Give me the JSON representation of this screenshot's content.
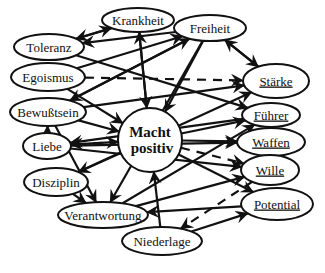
{
  "diagram": {
    "center": {
      "id": "macht",
      "line1": "Macht",
      "line2": "positiv",
      "x": 150,
      "y": 140,
      "r": 32
    },
    "nodes": [
      {
        "id": "krankheit",
        "label": "Krankheit",
        "x": 138,
        "y": 20,
        "rx": 36,
        "ry": 12,
        "underlined": false
      },
      {
        "id": "freiheit",
        "label": "Freiheit",
        "x": 210,
        "y": 28,
        "rx": 36,
        "ry": 13,
        "underlined": false
      },
      {
        "id": "toleranz",
        "label": "Toleranz",
        "x": 49,
        "y": 47,
        "rx": 35,
        "ry": 13,
        "underlined": false
      },
      {
        "id": "egoismus",
        "label": "Egoismus",
        "x": 48,
        "y": 77,
        "rx": 37,
        "ry": 14,
        "underlined": false
      },
      {
        "id": "staerke",
        "label": "Stärke",
        "x": 276,
        "y": 81,
        "rx": 33,
        "ry": 17,
        "underlined": true
      },
      {
        "id": "bewusstsein",
        "label": "Bewußtsein",
        "x": 48,
        "y": 112,
        "rx": 38,
        "ry": 14,
        "underlined": false
      },
      {
        "id": "fuehrer",
        "label": "Führer",
        "x": 271,
        "y": 115,
        "rx": 29,
        "ry": 12,
        "underlined": true
      },
      {
        "id": "liebe",
        "label": "Liebe",
        "x": 47,
        "y": 146,
        "rx": 24,
        "ry": 13,
        "underlined": false
      },
      {
        "id": "waffen",
        "label": "Waffen",
        "x": 271,
        "y": 142,
        "rx": 34,
        "ry": 14,
        "underlined": true
      },
      {
        "id": "disziplin",
        "label": "Disziplin",
        "x": 56,
        "y": 182,
        "rx": 32,
        "ry": 14,
        "underlined": false
      },
      {
        "id": "wille",
        "label": "Wille",
        "x": 270,
        "y": 170,
        "rx": 29,
        "ry": 15,
        "underlined": true
      },
      {
        "id": "verantwortung",
        "label": "Verantwortung",
        "x": 103,
        "y": 215,
        "rx": 45,
        "ry": 13,
        "underlined": false
      },
      {
        "id": "potential",
        "label": "Potential",
        "x": 277,
        "y": 204,
        "rx": 36,
        "ry": 16,
        "underlined": true
      },
      {
        "id": "niederlage",
        "label": "Niederlage",
        "x": 162,
        "y": 241,
        "rx": 40,
        "ry": 14,
        "underlined": false
      }
    ],
    "edges": [
      {
        "from": "krankheit",
        "to": "toleranz",
        "dashed": false
      },
      {
        "from": "toleranz",
        "to": "krankheit",
        "dashed": false
      },
      {
        "from": "freiheit",
        "to": "toleranz",
        "dashed": false
      },
      {
        "from": "macht",
        "to": "krankheit",
        "dashed": false
      },
      {
        "from": "egoismus",
        "to": "freiheit",
        "dashed": false
      },
      {
        "from": "egoismus",
        "to": "staerke",
        "dashed": true
      },
      {
        "from": "toleranz",
        "to": "fuehrer",
        "dashed": false
      },
      {
        "from": "krankheit",
        "to": "macht",
        "dashed": false
      },
      {
        "from": "freiheit",
        "to": "staerke",
        "dashed": false
      },
      {
        "from": "staerke",
        "to": "freiheit",
        "dashed": false
      },
      {
        "from": "freiheit",
        "to": "macht",
        "dashed": false
      },
      {
        "from": "bewusstsein",
        "to": "freiheit",
        "dashed": false
      },
      {
        "from": "freiheit",
        "to": "bewusstsein",
        "dashed": false
      },
      {
        "from": "bewusstsein",
        "to": "macht",
        "dashed": false
      },
      {
        "from": "freiheit",
        "to": "verantwortung",
        "dashed": false
      },
      {
        "from": "bewusstsein",
        "to": "staerke",
        "dashed": false
      },
      {
        "from": "liebe",
        "to": "bewusstsein",
        "dashed": false
      },
      {
        "from": "liebe",
        "to": "macht",
        "dashed": false
      },
      {
        "from": "macht",
        "to": "liebe",
        "dashed": true
      },
      {
        "from": "liebe",
        "to": "waffen",
        "dashed": false
      },
      {
        "from": "liebe",
        "to": "wille",
        "dashed": false
      },
      {
        "from": "disziplin",
        "to": "staerke",
        "dashed": false
      },
      {
        "from": "macht",
        "to": "disziplin",
        "dashed": false
      },
      {
        "from": "disziplin",
        "to": "verantwortung",
        "dashed": false
      },
      {
        "from": "bewusstsein",
        "to": "verantwortung",
        "dashed": false
      },
      {
        "from": "verantwortung",
        "to": "fuehrer",
        "dashed": false
      },
      {
        "from": "verantwortung",
        "to": "wille",
        "dashed": false
      },
      {
        "from": "potential",
        "to": "verantwortung",
        "dashed": false
      },
      {
        "from": "macht",
        "to": "fuehrer",
        "dashed": false
      },
      {
        "from": "macht",
        "to": "waffen",
        "dashed": false
      },
      {
        "from": "macht",
        "to": "wille",
        "dashed": true
      },
      {
        "from": "macht",
        "to": "potential",
        "dashed": false
      },
      {
        "from": "niederlage",
        "to": "macht",
        "dashed": false
      },
      {
        "from": "niederlage",
        "to": "potential",
        "dashed": false
      },
      {
        "from": "wille",
        "to": "niederlage",
        "dashed": true
      },
      {
        "from": "fuehrer",
        "to": "liebe",
        "dashed": false
      },
      {
        "from": "egoismus",
        "to": "macht",
        "dashed": false
      }
    ]
  }
}
